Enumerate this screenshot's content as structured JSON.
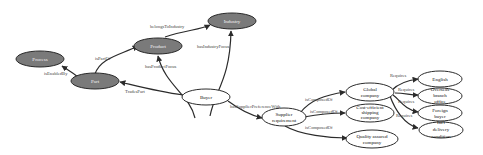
{
  "diagram": {
    "type": "ontology-graph",
    "colors": {
      "dark_node_fill": "#7a7a7a",
      "light_node_fill": "#ffffff",
      "edge": "#2b2b2b",
      "background": "#ffffff"
    },
    "nodes": {
      "process": {
        "label": "Process",
        "style": "dark"
      },
      "part": {
        "label": "Part",
        "style": "dark"
      },
      "product": {
        "label": "Product",
        "style": "dark"
      },
      "industry": {
        "label": "Industry",
        "style": "dark"
      },
      "buyer": {
        "label": "Buyer",
        "style": "light"
      },
      "supplier_requirement": {
        "label_line1": "Supplier",
        "label_line2": "requirement",
        "style": "light"
      },
      "global_company": {
        "label_line1": "Global",
        "label_line2": "company",
        "style": "light"
      },
      "cost_efficient": {
        "label_line1": "Cost-efficient",
        "label_line2": "shipping",
        "label_line3": "company",
        "style": "light"
      },
      "quality_assured": {
        "label_line1": "Quality assured",
        "label_line2": "company",
        "style": "light"
      },
      "english": {
        "label": "English",
        "style": "light"
      },
      "overseas_branch": {
        "label_line1": "Overseas",
        "label_line2": "branch",
        "label_line3": "office",
        "style": "light"
      },
      "foreign_buyer": {
        "label_line1": "Foreign",
        "label_line2": "buyer",
        "style": "light"
      },
      "delivery_condition": {
        "label_line1": "Int'l",
        "label_line2": "delivery",
        "label_line3": "condition",
        "style": "light"
      }
    },
    "edges": {
      "is_enabled_by": "isEnabledBy",
      "is_part_of": "isPartOf",
      "belongs_to_industry": "belongsToIndustry",
      "has_industry_focus": "hasIndustryFocus",
      "has_product_focus": "hasProductFocus",
      "trades_part": "TradesPart",
      "has_supplier_preference_with": "hasSupplierPreferenceWith",
      "is_composed_of_1": "isComposedOf",
      "is_composed_of_2": "isComposedOf",
      "is_composed_of_3": "isComposedOf",
      "requires_1": "Requires",
      "requires_2": "Requires",
      "requires_3": "Requires",
      "requires_4": "Requires"
    }
  }
}
